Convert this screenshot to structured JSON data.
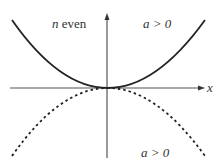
{
  "diagram": {
    "labels": {
      "top_left_var": "n",
      "top_left_text": " even",
      "top_right": "a > 0",
      "bottom_right": "a > 0",
      "x_axis": "x"
    },
    "curves": [
      {
        "name": "solid-parabola",
        "style": "solid",
        "opens": "up"
      },
      {
        "name": "dashed-parabola",
        "style": "dashed",
        "opens": "down"
      }
    ],
    "colors": {
      "stroke": "#222222",
      "axis": "#555555"
    }
  }
}
